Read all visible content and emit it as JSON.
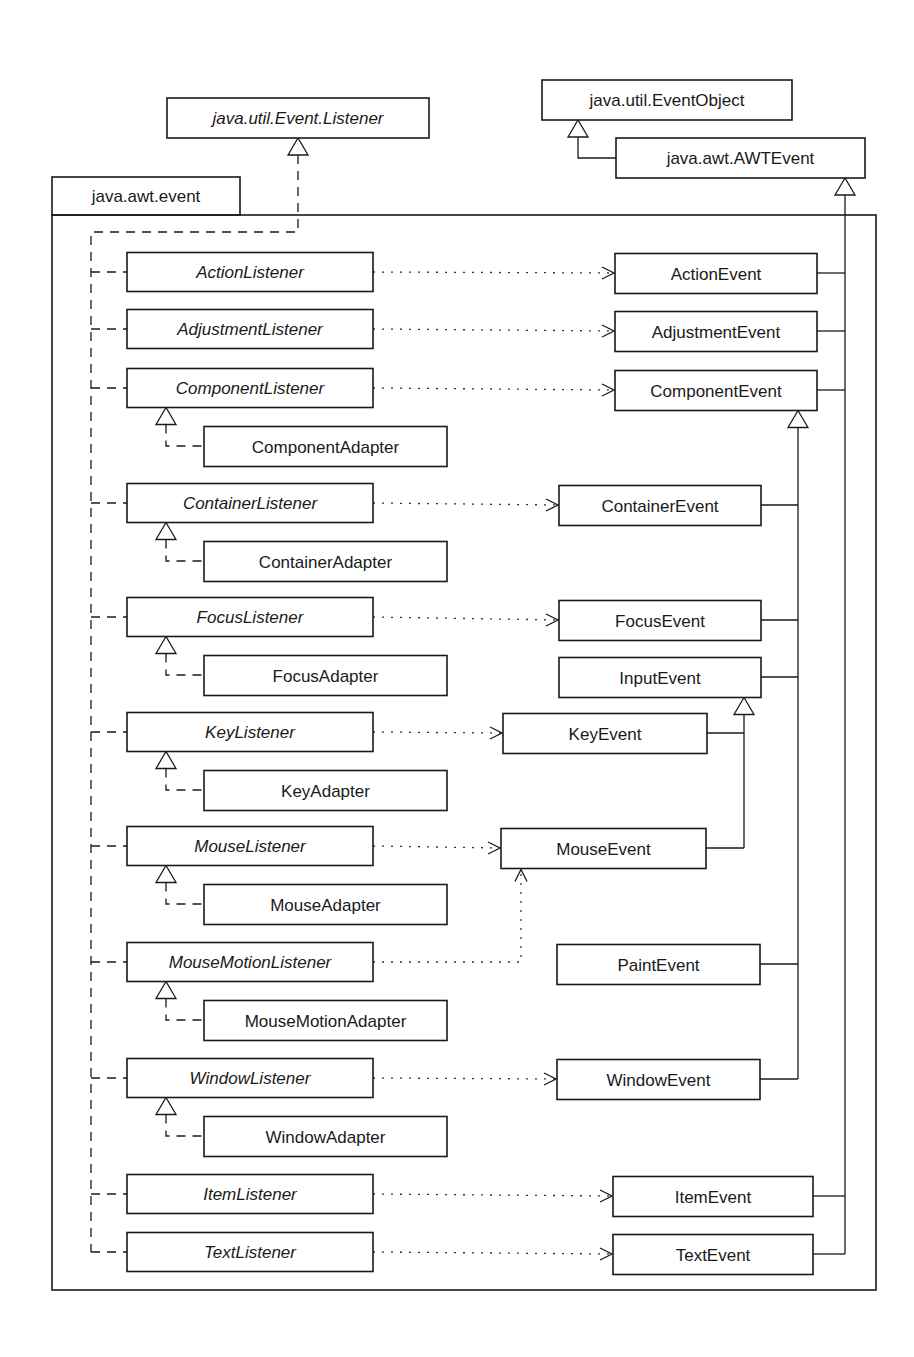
{
  "diagram": {
    "type": "UML class diagram",
    "package": {
      "name": "java.awt.event",
      "tab": {
        "x": 52,
        "y": 177,
        "w": 188,
        "h": 38
      },
      "body": {
        "x": 52,
        "y": 215,
        "w": 824,
        "h": 1075
      }
    },
    "external_classes": [
      {
        "id": "eventlistener",
        "name": "java.util.Event.Listener",
        "italic": true,
        "x": 167,
        "y": 98,
        "w": 262,
        "h": 40
      },
      {
        "id": "eventobject",
        "name": "java.util.EventObject",
        "italic": false,
        "x": 542,
        "y": 80,
        "w": 250,
        "h": 40
      },
      {
        "id": "awtevent",
        "name": "java.awt.AWTEvent",
        "italic": false,
        "x": 616,
        "y": 138,
        "w": 249,
        "h": 40
      }
    ],
    "listeners": [
      {
        "name": "ActionListener",
        "cy": 272,
        "event": "ActionEvent",
        "adapter": null
      },
      {
        "name": "AdjustmentListener",
        "cy": 329,
        "event": "AdjustmentEvent",
        "adapter": null
      },
      {
        "name": "ComponentListener",
        "cy": 388,
        "event": "ComponentEvent",
        "adapter": "ComponentAdapter"
      },
      {
        "name": "ContainerListener",
        "cy": 503,
        "event": "ContainerEvent",
        "adapter": "ContainerAdapter"
      },
      {
        "name": "FocusListener",
        "cy": 617,
        "event": "FocusEvent",
        "adapter": "FocusAdapter"
      },
      {
        "name": "KeyListener",
        "cy": 732,
        "event": "KeyEvent",
        "adapter": "KeyAdapter"
      },
      {
        "name": "MouseListener",
        "cy": 846,
        "event": "MouseEvent",
        "adapter": "MouseAdapter"
      },
      {
        "name": "MouseMotionListener",
        "cy": 962,
        "event": "MouseEvent",
        "adapter": "MouseMotionAdapter"
      },
      {
        "name": "WindowListener",
        "cy": 1078,
        "event": "WindowEvent",
        "adapter": "WindowAdapter"
      },
      {
        "name": "ItemListener",
        "cy": 1194,
        "event": "ItemEvent",
        "adapter": null
      },
      {
        "name": "TextListener",
        "cy": 1252,
        "event": "TextEvent",
        "adapter": null
      }
    ],
    "events": [
      {
        "name": "ActionEvent",
        "x": 615,
        "cy": 273,
        "w": 202,
        "parent": "java.awt.AWTEvent"
      },
      {
        "name": "AdjustmentEvent",
        "x": 615,
        "cy": 331,
        "w": 202,
        "parent": "java.awt.AWTEvent"
      },
      {
        "name": "ComponentEvent",
        "x": 615,
        "cy": 390,
        "w": 202,
        "parent": "java.awt.AWTEvent"
      },
      {
        "name": "ContainerEvent",
        "x": 559,
        "cy": 505,
        "w": 202,
        "parent": "ComponentEvent"
      },
      {
        "name": "FocusEvent",
        "x": 559,
        "cy": 620,
        "w": 202,
        "parent": "ComponentEvent"
      },
      {
        "name": "InputEvent",
        "x": 559,
        "cy": 677,
        "w": 202,
        "parent": "ComponentEvent"
      },
      {
        "name": "KeyEvent",
        "x": 503,
        "cy": 733,
        "w": 204,
        "parent": "InputEvent"
      },
      {
        "name": "MouseEvent",
        "x": 501,
        "cy": 848,
        "w": 205,
        "parent": "InputEvent"
      },
      {
        "name": "PaintEvent",
        "x": 557,
        "cy": 964,
        "w": 203,
        "parent": "ComponentEvent"
      },
      {
        "name": "WindowEvent",
        "x": 557,
        "cy": 1079,
        "w": 203,
        "parent": "ComponentEvent"
      },
      {
        "name": "ItemEvent",
        "x": 613,
        "cy": 1196,
        "w": 200,
        "parent": "java.awt.AWTEvent"
      },
      {
        "name": "TextEvent",
        "x": 613,
        "cy": 1254,
        "w": 200,
        "parent": "java.awt.AWTEvent"
      }
    ],
    "layout": {
      "listener_x": 127,
      "listener_w": 246,
      "box_h": 39,
      "adapter_x": 204,
      "adapter_w": 243,
      "adapter_dy": 58,
      "listener_bus_x": 91,
      "listener_bus_top": 232,
      "awt_trunk_x": 845,
      "component_trunk_x": 798,
      "input_trunk_x": 744
    },
    "colors": {
      "line": "#1a1a1a",
      "background": "#ffffff"
    }
  }
}
